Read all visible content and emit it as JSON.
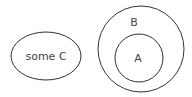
{
  "diagram": {
    "type": "euler",
    "sets": [
      {
        "id": "C",
        "label": "some C",
        "shape": "ellipse"
      },
      {
        "id": "B",
        "label": "B",
        "shape": "circle"
      },
      {
        "id": "A",
        "label": "A",
        "shape": "circle",
        "inside": "B"
      }
    ],
    "colors": {
      "stroke": "#333333",
      "text": "#444444",
      "background": "#ffffff"
    }
  }
}
